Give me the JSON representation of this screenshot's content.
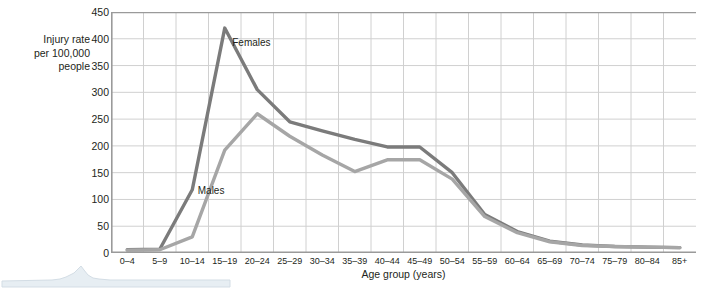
{
  "chart_data": {
    "type": "line",
    "title": "",
    "xlabel": "Age group (years)",
    "ylabel": "Injury rate per 100,000 people",
    "ylabel_lines": [
      "Injury rate",
      "per 100,000",
      "people"
    ],
    "categories": [
      "0–4",
      "5–9",
      "10–14",
      "15–19",
      "20–24",
      "25–29",
      "30–34",
      "35–39",
      "40–44",
      "45–49",
      "50–54",
      "55–59",
      "60–64",
      "65–69",
      "70–74",
      "75–79",
      "80–84",
      "85+"
    ],
    "ylim": [
      0,
      450
    ],
    "yticks": [
      0,
      50,
      100,
      150,
      200,
      250,
      300,
      350,
      400,
      450
    ],
    "ytick_labels": [
      "0",
      "50",
      "100",
      "150",
      "200",
      "250",
      "300",
      "350",
      "400",
      "450"
    ],
    "grid": true,
    "legend": "inline-annotations",
    "series": [
      {
        "name": "Females",
        "color": "#7b7b7b",
        "values": [
          6,
          7,
          118,
          420,
          305,
          245,
          228,
          212,
          198,
          198,
          150,
          72,
          40,
          22,
          15,
          12,
          11,
          10
        ],
        "label_x_index": 4,
        "label_text": "Females"
      },
      {
        "name": "Males",
        "color": "#a6a6a6",
        "values": [
          5,
          6,
          30,
          192,
          260,
          218,
          183,
          152,
          174,
          174,
          138,
          68,
          38,
          21,
          14,
          12,
          11,
          10
        ],
        "label_x_index": 3,
        "label_text": "Males"
      }
    ]
  },
  "annotations": {
    "females_label": "Females",
    "males_label": "Males"
  },
  "colors": {
    "females_line": "#7b7b7b",
    "males_line": "#a6a6a6",
    "grid": "#d0d0d0",
    "axis": "#9a9a9a",
    "text": "#231f20",
    "artifact": "#dfe6ec"
  }
}
